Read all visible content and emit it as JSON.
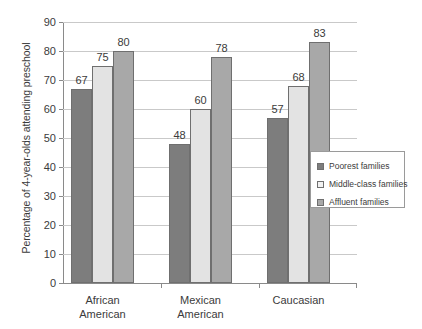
{
  "chart_data": {
    "type": "bar",
    "title": "",
    "xlabel": "",
    "ylabel": "Percentage of 4-year-olds attending preschool",
    "ylim": [
      0,
      90
    ],
    "ytick_labels": [
      "0",
      "10",
      "20",
      "30",
      "40",
      "50",
      "60",
      "70",
      "80",
      "90"
    ],
    "yticks": [
      0,
      10,
      20,
      30,
      40,
      50,
      60,
      70,
      80,
      90
    ],
    "grid": true,
    "legend_position": "right-middle",
    "categories": [
      "African American",
      "Mexican American",
      "Caucasian"
    ],
    "category_lines": [
      [
        "African",
        "American"
      ],
      [
        "Mexican",
        "American"
      ],
      [
        "Caucasian",
        ""
      ]
    ],
    "series": [
      {
        "name": "Poorest families",
        "color": "#7d7d7d",
        "values": [
          67,
          48,
          57
        ]
      },
      {
        "name": "Middle-class families",
        "color": "#e3e3e3",
        "values": [
          75,
          60,
          68
        ]
      },
      {
        "name": "Affluent families",
        "color": "#a8a8a8",
        "values": [
          80,
          78,
          83
        ]
      }
    ],
    "data_labels": [
      {
        "text": "67"
      },
      {
        "text": "75"
      },
      {
        "text": "80"
      },
      {
        "text": "48"
      },
      {
        "text": "60"
      },
      {
        "text": "78"
      },
      {
        "text": "57"
      },
      {
        "text": "68"
      },
      {
        "text": "83"
      }
    ]
  },
  "legend": {
    "items": [
      {
        "label": "Poorest families"
      },
      {
        "label": "Middle-class families"
      },
      {
        "label": "Affluent families"
      }
    ]
  }
}
